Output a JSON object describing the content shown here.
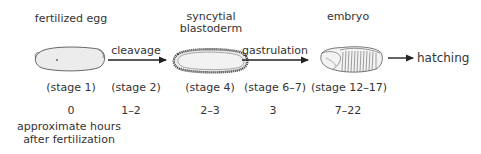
{
  "diagram": {
    "title_labels": {
      "fertilized_egg": "fertilized egg",
      "syncytial_blastoderm_line1": "syncytial",
      "syncytial_blastoderm_line2": "blastoderm",
      "embryo": "embryo"
    },
    "processes": {
      "cleavage": "cleavage",
      "gastrulation": "gastrulation",
      "hatching": "hatching"
    },
    "stages": [
      {
        "label": "(stage 1)",
        "hours": "0"
      },
      {
        "label": "(stage 2)",
        "hours": "1–2"
      },
      {
        "label": "(stage 4)",
        "hours": "2–3"
      },
      {
        "label": "(stage 6–7)",
        "hours": "3"
      },
      {
        "label": "(stage 12–17)",
        "hours": "7–22"
      }
    ],
    "hours_caption_line1": "approximate hours",
    "hours_caption_line2": "after fertilization",
    "colors": {
      "text": "#333333",
      "arrow": "#222222",
      "egg_fill": "#ececec",
      "outline": "#555555"
    }
  }
}
